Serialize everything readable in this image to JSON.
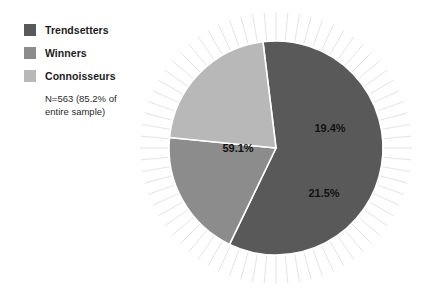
{
  "chart_data": {
    "type": "pie",
    "title": "",
    "legend_position": "left",
    "note": "N=563 (85.2% of entire sample)",
    "note_lines": [
      "N=563 (85.2% of",
      "entire sample)"
    ],
    "categories": [
      "Trendsetters",
      "Winners",
      "Connoisseurs"
    ],
    "values": [
      59.1,
      19.4,
      21.5
    ],
    "value_labels": [
      "59.1%",
      "19.4%",
      "21.5%"
    ],
    "unit": "percent",
    "colors": [
      "#595959",
      "#8c8c8c",
      "#b8b8b8"
    ],
    "slice_separator_color": "#ffffff",
    "background": "#ffffff",
    "sunburst_rays": {
      "count": 72,
      "color": "#c8c8c8",
      "inner_radius": 108,
      "outer_radius": 136
    },
    "geometry": {
      "center_x": 276,
      "center_y": 148,
      "radius": 107,
      "start_angle_deg": -7
    },
    "slices": [
      {
        "name": "Trendsetters",
        "value": 59.1,
        "label": "59.1%",
        "color": "#595959",
        "label_x": 238,
        "label_y": 152
      },
      {
        "name": "Winners",
        "value": 19.4,
        "label": "19.4%",
        "color": "#8c8c8c",
        "label_x": 330,
        "label_y": 132
      },
      {
        "name": "Connoisseurs",
        "value": 21.5,
        "label": "21.5%",
        "color": "#b8b8b8",
        "label_x": 324,
        "label_y": 197
      }
    ]
  },
  "legend": {
    "items": [
      {
        "label": "Trendsetters",
        "color": "#595959"
      },
      {
        "label": "Winners",
        "color": "#8c8c8c"
      },
      {
        "label": "Connoisseurs",
        "color": "#b8b8b8"
      }
    ],
    "note_line1": "N=563 (85.2% of",
    "note_line2": "entire sample)"
  }
}
